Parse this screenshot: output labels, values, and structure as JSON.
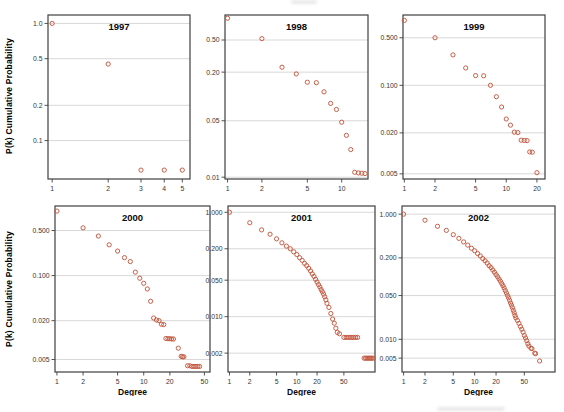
{
  "labels": {
    "ylabel": "P(k) Cumulative Probability",
    "xlabel": "Degree"
  },
  "style": {
    "point_color": "#c2573e",
    "cluster_color": "#b53a2a",
    "grid_color": "#d4d4d4",
    "frame_color": "#3f3f3f",
    "text_color": "#343434",
    "title_color": "#0a0a0a",
    "background": "#ffffff"
  },
  "chart_data": [
    {
      "type": "scatter",
      "title": "1997",
      "xlabel": "",
      "ylabel": "P(k) Cumulative Probability",
      "xscale": "log",
      "yscale": "log",
      "xticks": [
        1,
        2,
        3,
        4,
        5
      ],
      "yticks": [
        "1.0",
        "0.5",
        "0.2",
        "0.1"
      ],
      "xlim": [
        0.95,
        5.5
      ],
      "ylim": [
        0.047,
        1.18
      ],
      "x": [
        1,
        2,
        3,
        4,
        5
      ],
      "y": [
        1.0,
        0.45,
        0.056,
        0.056,
        0.056
      ]
    },
    {
      "type": "scatter",
      "title": "1998",
      "xlabel": "",
      "ylabel": "P(k) Cumulative Probability",
      "xscale": "log",
      "yscale": "log",
      "xticks": [
        1,
        2,
        5,
        10
      ],
      "yticks": [
        "0.50",
        "0.20",
        "0.05",
        "0.01"
      ],
      "xlim": [
        0.95,
        17
      ],
      "ylim": [
        0.0095,
        1.02
      ],
      "x": [
        1,
        2,
        3,
        4,
        5,
        6,
        7,
        8,
        9,
        10,
        11,
        12,
        13,
        14,
        15,
        16
      ],
      "y": [
        0.93,
        0.52,
        0.23,
        0.19,
        0.15,
        0.148,
        0.114,
        0.082,
        0.069,
        0.048,
        0.033,
        0.022,
        0.0115,
        0.0113,
        0.0112,
        0.0111
      ]
    },
    {
      "type": "scatter",
      "title": "1999",
      "xlabel": "",
      "ylabel": "P(k) Cumulative Probability",
      "xscale": "log",
      "yscale": "log",
      "xticks": [
        1,
        2,
        5,
        10,
        20
      ],
      "yticks": [
        "0.500",
        "0.100",
        "0.020",
        "0.005"
      ],
      "xlim": [
        0.97,
        24
      ],
      "ylim": [
        0.0042,
        1.08
      ],
      "x": [
        1,
        2,
        3,
        4,
        5,
        6,
        7,
        8,
        9,
        10,
        11,
        12,
        13,
        14,
        15,
        16,
        17,
        18,
        20
      ],
      "y": [
        0.9,
        0.5,
        0.28,
        0.18,
        0.139,
        0.138,
        0.1,
        0.068,
        0.048,
        0.032,
        0.026,
        0.0205,
        0.0202,
        0.0156,
        0.0155,
        0.0154,
        0.0105,
        0.0104,
        0.0052
      ]
    },
    {
      "type": "scatter",
      "title": "2000",
      "xlabel": "Degree",
      "ylabel": "P(k) Cumulative Probability",
      "xscale": "log",
      "yscale": "log",
      "xticks": [
        1,
        2,
        5,
        10,
        20,
        50
      ],
      "yticks": [
        "0.500",
        "0.100",
        "0.020",
        "0.005"
      ],
      "xlim": [
        0.95,
        58
      ],
      "ylim": [
        0.0032,
        1.2
      ],
      "x": [
        1,
        2,
        3,
        4,
        5,
        6,
        7,
        8,
        9,
        10,
        11,
        12,
        13,
        14,
        15,
        16,
        17,
        18,
        19,
        20,
        21,
        22,
        25,
        27,
        28,
        29,
        32,
        34,
        36,
        38,
        40,
        42,
        44
      ],
      "y": [
        1.0,
        0.55,
        0.41,
        0.3,
        0.24,
        0.19,
        0.165,
        0.113,
        0.091,
        0.076,
        0.062,
        0.04,
        0.022,
        0.0205,
        0.02,
        0.0176,
        0.0174,
        0.0106,
        0.0105,
        0.0105,
        0.0104,
        0.0104,
        0.0075,
        0.0056,
        0.0055,
        0.0055,
        0.004,
        0.004,
        0.0039,
        0.0039,
        0.0039,
        0.0039,
        0.0039
      ]
    },
    {
      "type": "scatter",
      "title": "2001",
      "xlabel": "Degree",
      "ylabel": "P(k) Cumulative Probability",
      "xscale": "log",
      "yscale": "log",
      "xticks": [
        1,
        2,
        5,
        10,
        20,
        50
      ],
      "yticks": [
        "1.000",
        "0.200",
        "0.050",
        "0.010",
        "0.002"
      ],
      "xlim": [
        0.95,
        145
      ],
      "ylim": [
        0.00087,
        1.32
      ],
      "x": [
        1,
        2,
        3,
        4,
        5,
        6,
        7,
        8,
        9,
        10,
        11,
        12,
        13,
        14,
        15,
        16,
        17,
        18,
        19,
        20,
        21,
        22,
        23,
        24,
        25,
        26,
        27,
        28,
        30,
        32,
        34,
        36,
        38,
        40,
        43,
        50,
        54,
        58,
        62,
        66,
        70,
        75,
        80,
        100,
        105,
        110,
        115,
        120,
        125,
        130,
        136
      ],
      "y": [
        1.0,
        0.63,
        0.46,
        0.38,
        0.31,
        0.26,
        0.225,
        0.2,
        0.175,
        0.155,
        0.135,
        0.12,
        0.105,
        0.095,
        0.085,
        0.075,
        0.066,
        0.059,
        0.052,
        0.046,
        0.041,
        0.037,
        0.033,
        0.03,
        0.027,
        0.024,
        0.021,
        0.018,
        0.015,
        0.0115,
        0.009,
        0.0075,
        0.006,
        0.005,
        0.0047,
        0.004,
        0.004,
        0.004,
        0.004,
        0.004,
        0.004,
        0.004,
        0.004,
        0.0016,
        0.0016,
        0.0016,
        0.0016,
        0.0016,
        0.0016,
        0.0016,
        0.0016
      ]
    },
    {
      "type": "scatter",
      "title": "2002",
      "xlabel": "Degree",
      "ylabel": "P(k) Cumulative Probability",
      "xscale": "log",
      "yscale": "log",
      "xticks": [
        1,
        2,
        5,
        10,
        20,
        50
      ],
      "yticks": [
        "1.000",
        "0.200",
        "0.050",
        "0.010",
        "0.005"
      ],
      "xlim": [
        0.95,
        135
      ],
      "ylim": [
        0.003,
        1.35
      ],
      "x": [
        1,
        2,
        3,
        4,
        5,
        6,
        7,
        8,
        9,
        10,
        11,
        12,
        13,
        14,
        15,
        16,
        17,
        18,
        19,
        20,
        21,
        22,
        23,
        24,
        25,
        26,
        27,
        28,
        29,
        30,
        31,
        32,
        33,
        34,
        35,
        36,
        37,
        38,
        40,
        42,
        44,
        46,
        48,
        50,
        52,
        54,
        56,
        58,
        62,
        64,
        70,
        72,
        82
      ],
      "y": [
        1.0,
        0.8,
        0.64,
        0.55,
        0.47,
        0.41,
        0.36,
        0.32,
        0.285,
        0.26,
        0.235,
        0.215,
        0.195,
        0.18,
        0.165,
        0.15,
        0.14,
        0.128,
        0.118,
        0.108,
        0.1,
        0.092,
        0.085,
        0.078,
        0.072,
        0.066,
        0.06,
        0.055,
        0.05,
        0.046,
        0.042,
        0.038,
        0.035,
        0.032,
        0.029,
        0.0265,
        0.024,
        0.022,
        0.02,
        0.018,
        0.016,
        0.0145,
        0.013,
        0.0115,
        0.0105,
        0.0095,
        0.0085,
        0.0078,
        0.0072,
        0.0071,
        0.006,
        0.0059,
        0.0045
      ]
    }
  ]
}
